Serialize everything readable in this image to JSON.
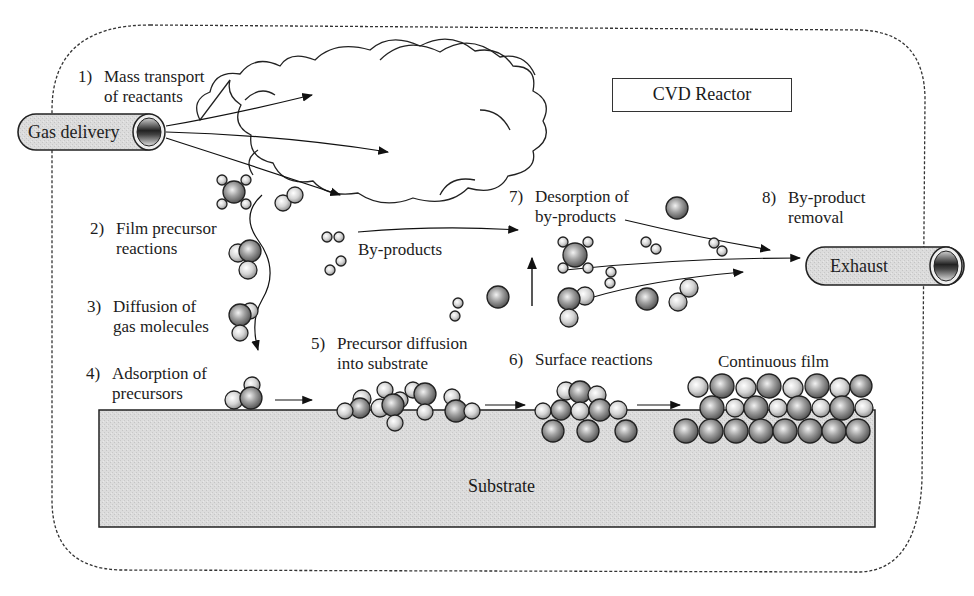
{
  "diagram": {
    "title": "CVD Reactor",
    "inlet": {
      "label": "Gas delivery",
      "icon": "pipe-inlet-icon"
    },
    "outlet": {
      "label": "Exhaust",
      "icon": "pipe-outlet-icon"
    },
    "substrate_label": "Substrate",
    "byproducts_label": "By-products",
    "film_label": "Continuous film",
    "steps": [
      {
        "num": "1)",
        "line1": "Mass transport",
        "line2": "of reactants"
      },
      {
        "num": "2)",
        "line1": "Film precursor",
        "line2": "reactions"
      },
      {
        "num": "3)",
        "line1": "Diffusion of",
        "line2": "gas molecules"
      },
      {
        "num": "4)",
        "line1": "Adsorption of",
        "line2": "precursors"
      },
      {
        "num": "5)",
        "line1": "Precursor diffusion",
        "line2": "into substrate"
      },
      {
        "num": "6)",
        "line1": "Surface reactions",
        "line2": ""
      },
      {
        "num": "7)",
        "line1": "Desorption of",
        "line2": "by-products"
      },
      {
        "num": "8)",
        "line1": "By-product",
        "line2": "removal"
      }
    ],
    "colors": {
      "outline": "#1e1e1e",
      "substrate_fill": "#d9d9d9",
      "pipe_fill": "#e6e6e6",
      "atom_light": "#f2f2f2",
      "atom_dark": "#7a7a7a"
    }
  }
}
